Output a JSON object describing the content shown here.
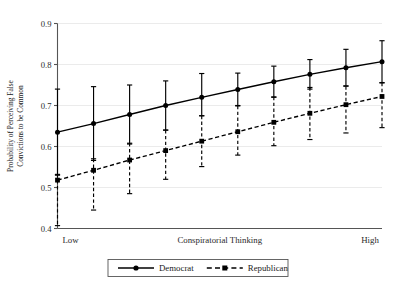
{
  "chart_data": {
    "type": "line",
    "title": "",
    "xlabel": "Conspiratorial Thinking",
    "ylabel": "Probability of Perceiving False Convictions to be Common",
    "ylabel_line1": "Probability of Perceiving False",
    "ylabel_line2": "Convictions to be Common",
    "ylim": [
      0.4,
      0.9
    ],
    "yticks": [
      0.4,
      0.5,
      0.6,
      0.7,
      0.8,
      0.9
    ],
    "ytick_labels": [
      "0.4",
      "0.5",
      "0.6",
      "0.7",
      "0.8",
      "0.9"
    ],
    "xlim": [
      1,
      10
    ],
    "xtick_labels": [
      "Low",
      "Conspiratorial Thinking",
      "High"
    ],
    "x": [
      1,
      2,
      3,
      4,
      5,
      6,
      7,
      8,
      9,
      10
    ],
    "grid": true,
    "grid_axis": "y",
    "legend_position": "bottom-center",
    "series": [
      {
        "name": "Democrat",
        "marker": "circle",
        "linestyle": "solid",
        "color": "#000000",
        "values": [
          0.635,
          0.656,
          0.678,
          0.7,
          0.72,
          0.739,
          0.758,
          0.776,
          0.792,
          0.807
        ],
        "ci_low": [
          0.53,
          0.566,
          0.606,
          0.64,
          0.675,
          0.7,
          0.72,
          0.74,
          0.748,
          0.756
        ],
        "ci_high": [
          0.74,
          0.746,
          0.75,
          0.76,
          0.778,
          0.779,
          0.796,
          0.812,
          0.837,
          0.858
        ]
      },
      {
        "name": "Republican",
        "marker": "square",
        "linestyle": "dashed",
        "color": "#000000",
        "values": [
          0.518,
          0.542,
          0.567,
          0.59,
          0.613,
          0.636,
          0.659,
          0.681,
          0.702,
          0.722
        ],
        "ci_low": [
          0.407,
          0.445,
          0.485,
          0.52,
          0.551,
          0.579,
          0.602,
          0.617,
          0.633,
          0.646
        ],
        "ci_high": [
          0.532,
          0.57,
          0.608,
          0.64,
          0.675,
          0.699,
          0.721,
          0.744,
          0.747,
          0.755
        ]
      }
    ]
  },
  "legend": {
    "items": [
      {
        "label": "Democrat",
        "marker": "circle",
        "linestyle": "solid"
      },
      {
        "label": "Republican",
        "marker": "square",
        "linestyle": "dashed"
      }
    ]
  }
}
